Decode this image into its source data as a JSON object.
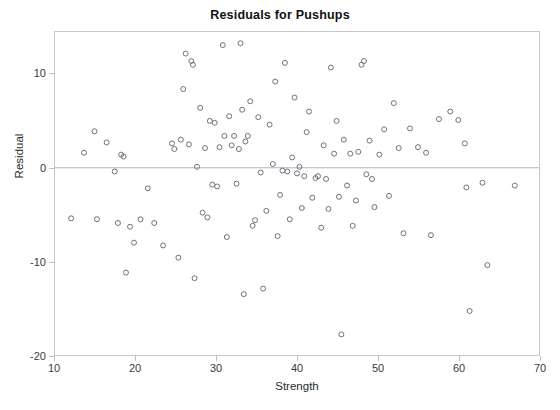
{
  "chart_data": {
    "type": "scatter",
    "title": "Residuals for Pushups",
    "xlabel": "Strength",
    "ylabel": "Residual",
    "xlim": [
      10,
      70
    ],
    "ylim": [
      -20,
      14.5
    ],
    "xticks": [
      10,
      20,
      30,
      40,
      50,
      60,
      70
    ],
    "yticks": [
      -20,
      -10,
      0,
      10
    ],
    "grid": false,
    "legend": null,
    "reference_line": {
      "y": 0,
      "color": "#b4b4b4"
    },
    "marker": {
      "shape": "open-circle",
      "color": "#6e6e80",
      "size": 5
    },
    "series": [
      {
        "name": "Residuals",
        "points": [
          [
            12.0,
            -5.4
          ],
          [
            13.6,
            1.6
          ],
          [
            14.9,
            3.9
          ],
          [
            15.2,
            -5.5
          ],
          [
            16.4,
            2.7
          ],
          [
            17.4,
            -0.4
          ],
          [
            17.8,
            -5.9
          ],
          [
            18.2,
            1.4
          ],
          [
            18.5,
            1.2
          ],
          [
            18.8,
            -11.2
          ],
          [
            19.3,
            -6.3
          ],
          [
            19.8,
            -8.0
          ],
          [
            20.6,
            -5.5
          ],
          [
            21.5,
            -2.2
          ],
          [
            22.3,
            -5.9
          ],
          [
            23.4,
            -8.3
          ],
          [
            24.5,
            2.6
          ],
          [
            24.8,
            2.0
          ],
          [
            25.3,
            -9.6
          ],
          [
            25.6,
            3.0
          ],
          [
            25.9,
            8.4
          ],
          [
            26.2,
            12.2
          ],
          [
            26.6,
            2.5
          ],
          [
            26.9,
            11.4
          ],
          [
            27.1,
            11.0
          ],
          [
            27.3,
            -11.8
          ],
          [
            27.6,
            0.1
          ],
          [
            28.0,
            6.4
          ],
          [
            28.3,
            -4.8
          ],
          [
            28.6,
            2.1
          ],
          [
            28.9,
            -5.3
          ],
          [
            29.2,
            5.0
          ],
          [
            29.5,
            -1.8
          ],
          [
            29.8,
            4.8
          ],
          [
            30.1,
            -2.0
          ],
          [
            30.4,
            2.2
          ],
          [
            30.8,
            13.1
          ],
          [
            31.0,
            3.4
          ],
          [
            31.3,
            -7.4
          ],
          [
            31.6,
            5.5
          ],
          [
            31.9,
            2.4
          ],
          [
            32.2,
            3.4
          ],
          [
            32.5,
            -1.7
          ],
          [
            32.8,
            2.0
          ],
          [
            33.0,
            13.3
          ],
          [
            33.2,
            6.2
          ],
          [
            33.4,
            -13.5
          ],
          [
            33.6,
            2.8
          ],
          [
            33.9,
            3.4
          ],
          [
            34.2,
            7.1
          ],
          [
            34.5,
            -6.2
          ],
          [
            34.8,
            -5.6
          ],
          [
            35.2,
            5.4
          ],
          [
            35.5,
            -0.5
          ],
          [
            35.8,
            -12.9
          ],
          [
            36.2,
            -4.6
          ],
          [
            36.6,
            4.6
          ],
          [
            37.0,
            0.4
          ],
          [
            37.3,
            9.2
          ],
          [
            37.6,
            -7.3
          ],
          [
            37.9,
            -2.9
          ],
          [
            38.2,
            -0.3
          ],
          [
            38.5,
            11.2
          ],
          [
            38.8,
            -0.4
          ],
          [
            39.1,
            -5.5
          ],
          [
            39.4,
            1.1
          ],
          [
            39.7,
            7.5
          ],
          [
            40.0,
            -0.6
          ],
          [
            40.3,
            0.1
          ],
          [
            40.6,
            -4.3
          ],
          [
            40.9,
            -0.9
          ],
          [
            41.2,
            3.8
          ],
          [
            41.5,
            6.0
          ],
          [
            41.9,
            -3.2
          ],
          [
            42.3,
            -1.1
          ],
          [
            42.6,
            -0.9
          ],
          [
            43.0,
            -6.4
          ],
          [
            43.3,
            2.4
          ],
          [
            43.6,
            -1.2
          ],
          [
            43.9,
            -4.4
          ],
          [
            44.2,
            10.7
          ],
          [
            44.6,
            1.5
          ],
          [
            44.9,
            5.0
          ],
          [
            45.2,
            -3.1
          ],
          [
            45.5,
            -17.8
          ],
          [
            45.8,
            3.0
          ],
          [
            46.2,
            -1.9
          ],
          [
            46.6,
            1.5
          ],
          [
            46.9,
            -6.2
          ],
          [
            47.3,
            -3.5
          ],
          [
            47.6,
            1.7
          ],
          [
            48.0,
            11.0
          ],
          [
            48.3,
            11.4
          ],
          [
            48.6,
            -0.7
          ],
          [
            49.0,
            2.9
          ],
          [
            49.3,
            -1.2
          ],
          [
            49.6,
            -4.2
          ],
          [
            50.2,
            1.4
          ],
          [
            50.8,
            4.1
          ],
          [
            51.4,
            -3.0
          ],
          [
            52.0,
            6.9
          ],
          [
            52.6,
            2.1
          ],
          [
            53.2,
            -7.0
          ],
          [
            54.0,
            4.2
          ],
          [
            55.0,
            2.2
          ],
          [
            56.0,
            1.6
          ],
          [
            56.6,
            -7.2
          ],
          [
            57.6,
            5.2
          ],
          [
            59.0,
            6.0
          ],
          [
            60.0,
            5.1
          ],
          [
            60.8,
            2.6
          ],
          [
            61.0,
            -2.1
          ],
          [
            61.4,
            -15.3
          ],
          [
            63.0,
            -1.6
          ],
          [
            63.6,
            -10.4
          ],
          [
            67.0,
            -1.9
          ]
        ]
      }
    ]
  }
}
